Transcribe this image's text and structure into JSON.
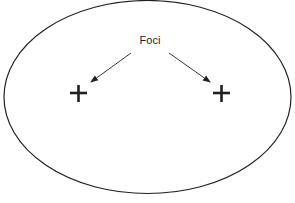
{
  "diagram": {
    "type": "ellipse-foci",
    "label": "Foci",
    "ellipse": {
      "cx": 147.5,
      "cy": 97,
      "rx": 143.5,
      "ry": 96.5,
      "stroke": "#231f20"
    },
    "foci": [
      {
        "name": "left-focus",
        "x": 78,
        "y": 93,
        "symbol": "+"
      },
      {
        "name": "right-focus",
        "x": 221,
        "y": 93,
        "symbol": "+"
      }
    ],
    "arrows": [
      {
        "from": [
          131,
          53
        ],
        "to": [
          91,
          82
        ]
      },
      {
        "from": [
          169,
          53
        ],
        "to": [
          210,
          82
        ]
      }
    ]
  }
}
